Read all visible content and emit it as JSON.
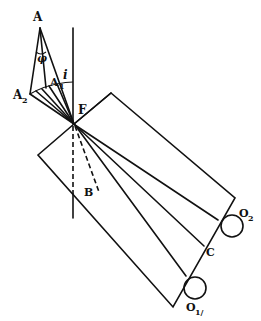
{
  "diagram": {
    "labels": {
      "A": "A",
      "A1": "A",
      "A1_sub": "1",
      "A2": "A",
      "A2_sub": "2",
      "phi": "φ",
      "i": "i",
      "F": "F",
      "B": "B",
      "C": "C",
      "O1": "O",
      "O1_sub": "1/",
      "O2": "O",
      "O2_sub": "2"
    },
    "colors": {
      "stroke": "#111111",
      "background": "#ffffff"
    }
  }
}
